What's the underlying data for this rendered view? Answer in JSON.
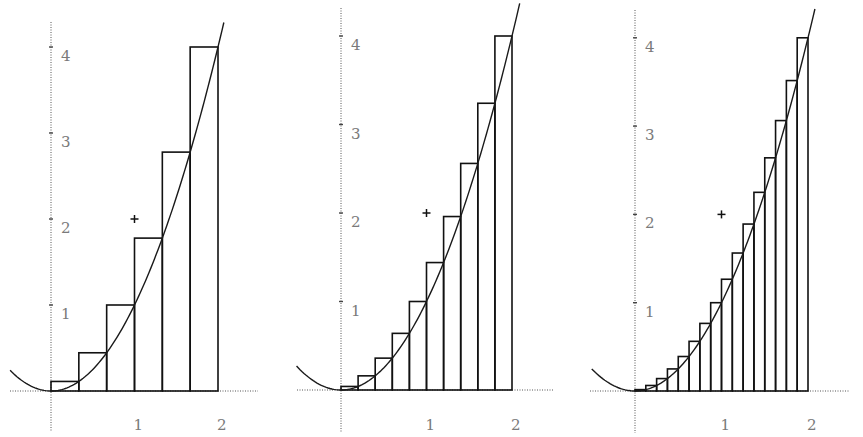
{
  "chart_data": [
    {
      "type": "bar",
      "title": "",
      "description": "Right-endpoint Riemann sum of y = x^2 on [0,2], n = 6",
      "function": "x^2",
      "interval": [
        0,
        2
      ],
      "n": 6,
      "categories": [
        "0–0.333",
        "0.333–0.667",
        "0.667–1",
        "1–1.333",
        "1.333–1.667",
        "1.667–2"
      ],
      "values": [
        0.111,
        0.444,
        1.0,
        1.778,
        2.778,
        4.0
      ],
      "marker": {
        "x": 1,
        "y": 2,
        "symbol": "+"
      },
      "xticks": [
        "1",
        "2"
      ],
      "yticks": [
        "1",
        "2",
        "3",
        "4"
      ],
      "xlim": [
        -0.5,
        2.5
      ],
      "ylim": [
        -0.45,
        4.3
      ],
      "grid": false,
      "xlabel": "",
      "ylabel": ""
    },
    {
      "type": "bar",
      "title": "",
      "description": "Right-endpoint Riemann sum of y = x^2 on [0,2], n = 10",
      "function": "x^2",
      "interval": [
        0,
        2
      ],
      "n": 10,
      "categories": [
        "0–0.2",
        "0.2–0.4",
        "0.4–0.6",
        "0.6–0.8",
        "0.8–1",
        "1–1.2",
        "1.2–1.4",
        "1.4–1.6",
        "1.6–1.8",
        "1.8–2"
      ],
      "values": [
        0.04,
        0.16,
        0.36,
        0.64,
        1.0,
        1.44,
        1.96,
        2.56,
        3.24,
        4.0
      ],
      "marker": {
        "x": 1,
        "y": 2,
        "symbol": "+"
      },
      "xticks": [
        "1",
        "2"
      ],
      "yticks": [
        "1",
        "2",
        "3",
        "4"
      ],
      "xlim": [
        -0.5,
        2.5
      ],
      "ylim": [
        -0.45,
        4.3
      ],
      "grid": false,
      "xlabel": "",
      "ylabel": ""
    },
    {
      "type": "bar",
      "title": "",
      "description": "Right-endpoint Riemann sum of y = x^2 on [0,2], n = 16",
      "function": "x^2",
      "interval": [
        0,
        2
      ],
      "n": 16,
      "categories": [
        "0.125",
        "0.25",
        "0.375",
        "0.5",
        "0.625",
        "0.75",
        "0.875",
        "1",
        "1.125",
        "1.25",
        "1.375",
        "1.5",
        "1.625",
        "1.75",
        "1.875",
        "2"
      ],
      "values": [
        0.016,
        0.063,
        0.141,
        0.25,
        0.391,
        0.563,
        0.766,
        1.0,
        1.266,
        1.563,
        1.891,
        2.25,
        2.641,
        3.063,
        3.516,
        4.0
      ],
      "marker": {
        "x": 1,
        "y": 2,
        "symbol": "+"
      },
      "xticks": [
        "1",
        "2"
      ],
      "yticks": [
        "1",
        "2",
        "3",
        "4"
      ],
      "xlim": [
        -0.5,
        2.5
      ],
      "ylim": [
        -0.45,
        4.3
      ],
      "grid": false,
      "xlabel": "",
      "ylabel": ""
    }
  ],
  "panels": [
    {
      "origin_px": [
        51,
        391
      ],
      "unit_x": 83.5,
      "unit_y": 86,
      "axis_x_from": 10,
      "axis_x_to": 258,
      "axis_y_top": 22,
      "axis_y_bottom": 432,
      "curve_x_range": [
        -0.49,
        2.07
      ],
      "x_labels": [
        {
          "text": "1",
          "x": 1
        },
        {
          "text": "2",
          "x": 2
        }
      ],
      "y_labels": [
        {
          "text": "1",
          "y": 1
        },
        {
          "text": "2",
          "y": 2
        },
        {
          "text": "3",
          "y": 3
        },
        {
          "text": "4",
          "y": 4
        }
      ]
    },
    {
      "origin_px": [
        341,
        390
      ],
      "unit_x": 85.5,
      "unit_y": 88.5,
      "axis_x_from": 297,
      "axis_x_to": 553,
      "axis_y_top": 8,
      "axis_y_bottom": 433,
      "curve_x_range": [
        -0.52,
        2.09
      ],
      "x_labels": [
        {
          "text": "1",
          "x": 1
        },
        {
          "text": "2",
          "x": 2
        }
      ],
      "y_labels": [
        {
          "text": "1",
          "y": 1
        },
        {
          "text": "2",
          "y": 2
        },
        {
          "text": "3",
          "y": 3
        },
        {
          "text": "4",
          "y": 4
        }
      ]
    },
    {
      "origin_px": [
        635,
        391
      ],
      "unit_x": 86.5,
      "unit_y": 88.3,
      "axis_x_from": 590,
      "axis_x_to": 850,
      "axis_y_top": 10,
      "axis_y_bottom": 433,
      "curve_x_range": [
        -0.5,
        2.08
      ],
      "x_labels": [
        {
          "text": "1",
          "x": 1
        },
        {
          "text": "2",
          "x": 2
        }
      ],
      "y_labels": [
        {
          "text": "1",
          "y": 1
        },
        {
          "text": "2",
          "y": 2
        },
        {
          "text": "3",
          "y": 3
        },
        {
          "text": "4",
          "y": 4
        }
      ]
    }
  ]
}
